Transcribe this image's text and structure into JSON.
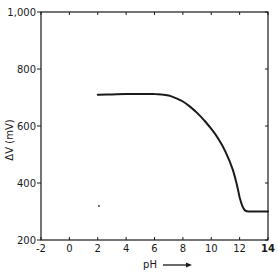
{
  "chart_data": {
    "type": "line",
    "title": "",
    "xlabel": "pH",
    "ylabel": "ΔV (mV)",
    "xlim": [
      -2,
      14
    ],
    "ylim": [
      200,
      1000
    ],
    "grid": false,
    "legend": null,
    "x_ticks": [
      -2,
      0,
      2,
      4,
      6,
      8,
      10,
      12,
      14
    ],
    "x_tick_labels": [
      "-2",
      "0",
      "2",
      "4",
      "6",
      "8",
      "10",
      "12",
      "14"
    ],
    "y_ticks": [
      200,
      400,
      600,
      800,
      1000
    ],
    "y_tick_labels": [
      "200",
      "400",
      "600",
      "800",
      "1,000"
    ],
    "series": [
      {
        "name": "ΔV vs pH",
        "x": [
          2,
          3,
          4,
          5,
          6,
          6.5,
          7,
          7.5,
          8,
          8.5,
          9,
          9.5,
          10,
          10.5,
          11,
          11.5,
          11.8,
          12.0,
          12.2,
          12.4,
          12.7,
          13,
          14
        ],
        "y": [
          710,
          711,
          712,
          712,
          712,
          711,
          707,
          698,
          686,
          668,
          646,
          620,
          590,
          555,
          510,
          450,
          395,
          350,
          318,
          303,
          300,
          300,
          300
        ]
      }
    ],
    "annotations": [
      {
        "type": "arrow",
        "text": "pH →",
        "position": "below x-axis"
      }
    ]
  },
  "axes": {
    "xlabel": "pH",
    "ylabel": "ΔV (mV)",
    "x_tick_labels": [
      "-2",
      "0",
      "2",
      "4",
      "6",
      "8",
      "10",
      "12",
      "14"
    ],
    "y_tick_labels": [
      "200",
      "400",
      "600",
      "800",
      "1,000"
    ]
  }
}
